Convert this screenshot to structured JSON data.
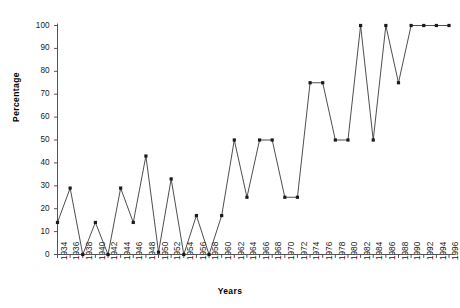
{
  "chart_data": {
    "type": "line",
    "title": "",
    "xlabel": "Years",
    "ylabel": "Percentage",
    "ylim": [
      0,
      100
    ],
    "ytick_labels": [
      "0",
      "10",
      "20",
      "30",
      "40",
      "50",
      "60",
      "70",
      "80",
      "90",
      "100"
    ],
    "yticks": [
      0,
      10,
      20,
      30,
      40,
      50,
      60,
      70,
      80,
      90,
      100
    ],
    "grid": false,
    "legend": "none",
    "marker": "square",
    "line_color": "#3a3a3a",
    "marker_color": "#1a1a1a",
    "axis_color": "#555555",
    "categories": [
      "1934",
      "1936",
      "1938",
      "1940",
      "1942",
      "1944",
      "1946",
      "1948",
      "1950",
      "1952",
      "1954",
      "1956",
      "1958",
      "1960",
      "1962",
      "1964",
      "1966",
      "1968",
      "1970",
      "1972",
      "1974",
      "1976",
      "1978",
      "1980",
      "1982",
      "1984",
      "1986",
      "1988",
      "1990",
      "1992",
      "1994",
      "1996"
    ],
    "values": [
      14,
      29,
      0,
      14,
      0,
      29,
      14,
      43,
      1,
      33,
      0,
      17,
      0,
      17,
      50,
      25,
      50,
      50,
      25,
      25,
      75,
      75,
      50,
      50,
      100,
      50,
      100,
      75,
      100,
      100,
      100,
      100
    ]
  }
}
